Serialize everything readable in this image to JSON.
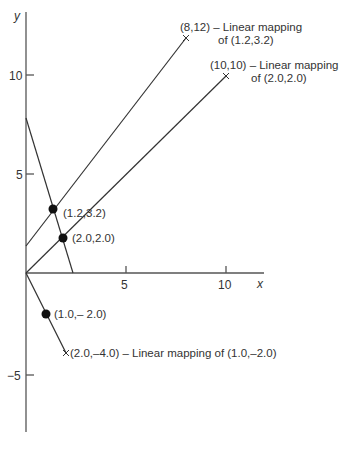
{
  "axes": {
    "x_label": "x",
    "y_label": "y",
    "x_ticks": [
      {
        "value": 5,
        "label": "5"
      },
      {
        "value": 10,
        "label": "10"
      }
    ],
    "y_ticks": [
      {
        "value": 10,
        "label": "10"
      },
      {
        "value": 5,
        "label": "5"
      },
      {
        "value": -5,
        "label": "−5"
      }
    ]
  },
  "points": [
    {
      "id": "p1",
      "label": "(1.2,3.2)",
      "x": 1.2,
      "y": 3.2,
      "marker": "dot"
    },
    {
      "id": "p2",
      "label": "(2.0,2.0)",
      "x": 2.0,
      "y": 2.0,
      "marker": "dot"
    },
    {
      "id": "p3",
      "label": "(1.0,– 2.0)",
      "x": 1.0,
      "y": -2.0,
      "marker": "dot"
    }
  ],
  "mapped_points": [
    {
      "id": "m1",
      "line1": "(8,12) – Linear mapping",
      "line2": "of (1.2,3.2)",
      "x": 8,
      "y": 12,
      "marker": "cross"
    },
    {
      "id": "m2",
      "line1": "(10,10) – Linear mapping",
      "line2": "of (2.0,2.0)",
      "x": 10,
      "y": 10,
      "marker": "cross"
    },
    {
      "id": "m3",
      "line1": "(2.0,–4.0) – Linear mapping of  (1.0,–2.0)",
      "x": 2.0,
      "y": -4.0,
      "marker": "cross"
    }
  ],
  "lines": [
    {
      "id": "line-through-origin-2-2",
      "description": "Line from origin through (2.0,2.0) to (10,10)"
    },
    {
      "id": "line-through-1.2-3.2",
      "description": "Line through (1.2,3.2) to (8,12)"
    },
    {
      "id": "descending-line",
      "description": "Line through (1.2,3.2) and (2.0,2.0) crossing x axis"
    },
    {
      "id": "line-through-origin-1-neg2",
      "description": "Line from origin through (1.0,-2.0) to (2.0,-4.0)"
    }
  ]
}
